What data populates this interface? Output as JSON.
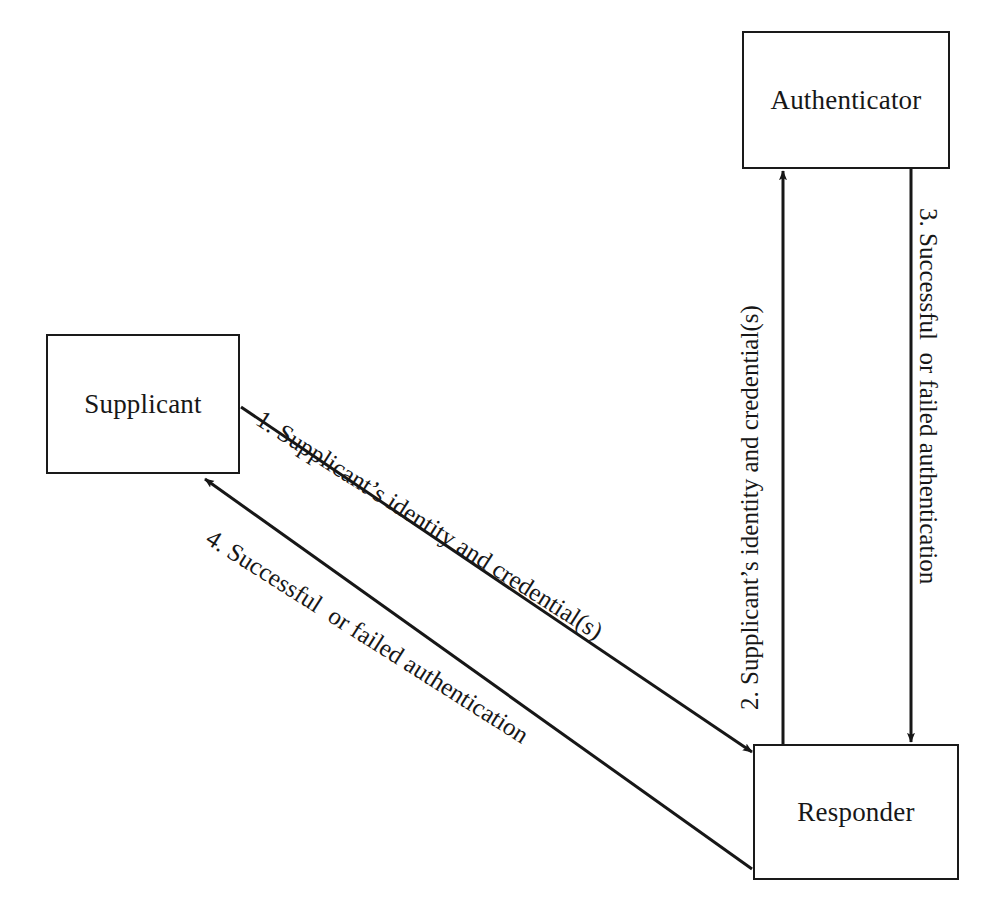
{
  "page": {
    "background_color": "#ffffff",
    "ink_color": "#171717",
    "width": 995,
    "height": 912
  },
  "nodes": [
    {
      "id": "authenticator",
      "label": "Authenticator"
    },
    {
      "id": "supplicant",
      "label": "Supplicant"
    },
    {
      "id": "responder",
      "label": "Responder"
    }
  ],
  "edges": [
    {
      "id": "edge-1",
      "number": "1.",
      "label": "1. Supplicant’s identity and credential(s)",
      "from": "supplicant",
      "to": "responder",
      "direction": "diagonal-down-right"
    },
    {
      "id": "edge-2",
      "number": "2.",
      "label": "2. Supplicant’s identity and credential(s)",
      "from": "responder",
      "to": "authenticator",
      "direction": "vertical-up"
    },
    {
      "id": "edge-3",
      "number": "3.",
      "label": "3. Successful  or failed authentication",
      "from": "authenticator",
      "to": "responder",
      "direction": "vertical-down"
    },
    {
      "id": "edge-4",
      "number": "4.",
      "label": "4. Successful  or failed authentication",
      "from": "responder",
      "to": "supplicant",
      "direction": "diagonal-up-left"
    }
  ]
}
